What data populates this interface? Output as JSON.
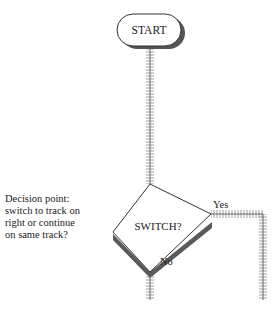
{
  "diagram": {
    "start_node": {
      "label": "START",
      "shape": "rounded-rectangle"
    },
    "decision_node": {
      "label": "SWITCH?",
      "shape": "diamond"
    },
    "branches": [
      {
        "label": "Yes",
        "direction": "right then down"
      },
      {
        "label": "No",
        "direction": "down"
      }
    ],
    "annotation": {
      "lines": [
        "Decision point:",
        "switch to track on",
        "right or continue",
        "on same track?"
      ]
    },
    "connector_style": "railroad-track",
    "colors": {
      "outline": "#333333",
      "shadow": "#666666",
      "track": "#777777",
      "background": "#ffffff"
    }
  }
}
